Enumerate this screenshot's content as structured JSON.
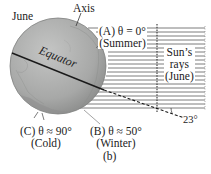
{
  "figure": {
    "month_label": "June",
    "axis_label": "Axis",
    "equator_label": "Equator",
    "panel_label": "(b)",
    "tilt_angle_label": "23°",
    "sun_rays": {
      "line1": "Sun’s",
      "line2": "rays",
      "line3": "(June)"
    },
    "points": [
      {
        "id": "A",
        "line1": "(A) θ = 0°",
        "line2": "(Summer)"
      },
      {
        "id": "B",
        "line1": "(B) θ ≈ 50°",
        "line2": "(Winter)"
      },
      {
        "id": "C",
        "line1": "(C) θ ≈ 90°",
        "line2": "(Cold)"
      }
    ],
    "colors": {
      "globe": "#a9aaa9",
      "globe_dark": "#8c8d8c",
      "rays": "#555555",
      "lines": "#222222"
    }
  }
}
